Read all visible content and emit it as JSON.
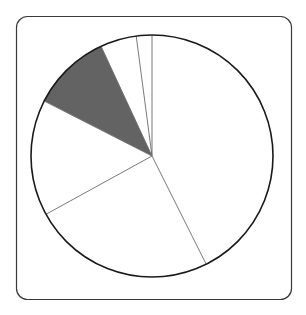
{
  "figure": {
    "title": "",
    "frame": {
      "x": 16.5,
      "y": 16.5,
      "width": 275,
      "height": 283,
      "corner_radius": 11,
      "stroke_color": "#3a3a3a",
      "stroke_width": 1.2,
      "fill_color": "#ffffff"
    },
    "background_color": "#ffffff"
  },
  "chart_data": {
    "type": "pie",
    "title": "",
    "xlabel": "",
    "ylabel": "",
    "legend": [],
    "grid": false,
    "center": {
      "cx": 152,
      "cy": 156
    },
    "radius": 121,
    "start_angle_deg": 90,
    "direction": "counterclockwise",
    "outline_color": "#1a1a1a",
    "outline_width": 1.6,
    "slice_divider_color": "#6a6a6a",
    "slice_divider_width": 0.9,
    "categories": [
      "Slice 1",
      "Slice 2",
      "Slice 3",
      "Slice 4",
      "Slice 5",
      "Slice 6"
    ],
    "values": [
      7.5,
      17.4,
      38.1,
      55.8,
      87.8,
      153.4
    ],
    "percentages": [
      2.1,
      4.8,
      10.6,
      15.5,
      24.4,
      42.6
    ],
    "angles_deg": [
      7.5,
      17.4,
      38.1,
      55.8,
      87.8,
      153.4
    ],
    "boundary_angles_deg": [
      0,
      7.5,
      24.9,
      63.0,
      118.8,
      206.6,
      360
    ],
    "colors": [
      "#ffffff",
      "#ffffff",
      "#636363",
      "#ffffff",
      "#ffffff",
      "#ffffff"
    ],
    "highlighted_index": 2,
    "highlight_color": "#636363",
    "unhighlighted_color": "#ffffff"
  }
}
